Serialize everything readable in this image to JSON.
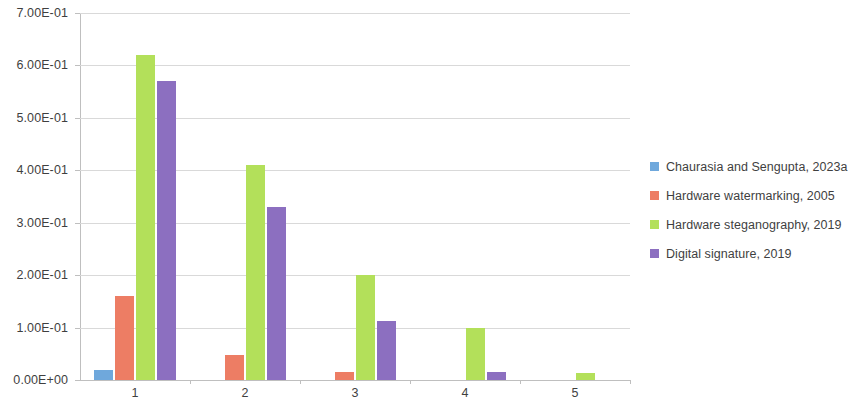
{
  "chart_data": {
    "type": "bar",
    "title": "",
    "xlabel": "",
    "ylabel": "",
    "categories": [
      "1",
      "2",
      "3",
      "4",
      "5"
    ],
    "ylim": [
      0,
      0.7
    ],
    "y_ticks": [
      0,
      0.1,
      0.2,
      0.3,
      0.4,
      0.5,
      0.6,
      0.7
    ],
    "y_tick_labels": [
      "0.00E+00",
      "1.00E-01",
      "2.00E-01",
      "3.00E-01",
      "4.00E-01",
      "5.00E-01",
      "6.00E-01",
      "7.00E-01"
    ],
    "grid": true,
    "legend_position": "right",
    "series": [
      {
        "name": "Chaurasia and Sengupta, 2023a",
        "color": "#6FA8DC",
        "values": [
          0.02,
          0,
          0,
          0,
          0
        ]
      },
      {
        "name": "Hardware watermarking, 2005",
        "color": "#ED7D64",
        "values": [
          0.16,
          0.047,
          0.015,
          0,
          0
        ]
      },
      {
        "name": "Hardware steganography, 2019",
        "color": "#B3E05A",
        "values": [
          0.62,
          0.41,
          0.2,
          0.1,
          0.013
        ]
      },
      {
        "name": "Digital signature, 2019",
        "color": "#8C6FC0",
        "values": [
          0.57,
          0.33,
          0.113,
          0.015,
          0
        ]
      }
    ]
  },
  "legend": {
    "items": [
      {
        "label": "Chaurasia and Sengupta, 2023a",
        "color": "#6FA8DC"
      },
      {
        "label": "Hardware watermarking, 2005",
        "color": "#ED7D64"
      },
      {
        "label": "Hardware steganography, 2019",
        "color": "#B3E05A"
      },
      {
        "label": "Digital signature, 2019",
        "color": "#8C6FC0"
      }
    ]
  }
}
